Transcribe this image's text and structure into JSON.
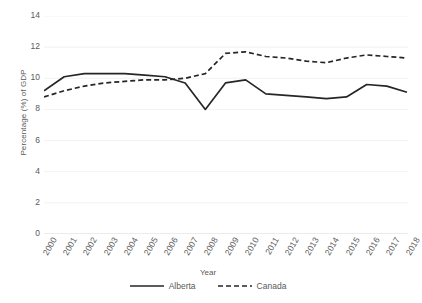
{
  "chart_data": {
    "type": "line",
    "title": "",
    "xlabel": "Year",
    "ylabel": "Percentage (%) of GDP",
    "x": [
      2000,
      2001,
      2002,
      2003,
      2004,
      2005,
      2006,
      2007,
      2008,
      2009,
      2010,
      2011,
      2012,
      2013,
      2014,
      2015,
      2016,
      2017,
      2018
    ],
    "categories": [
      "2000",
      "2001",
      "2002",
      "2003",
      "2004",
      "2005",
      "2006",
      "2007",
      "2008",
      "2009",
      "2010",
      "2011",
      "2012",
      "2013",
      "2014",
      "2015",
      "2016",
      "2017",
      "2018"
    ],
    "series": [
      {
        "name": "Alberta",
        "style": "solid",
        "color": "#262626",
        "values": [
          9.2,
          10.1,
          10.3,
          10.3,
          10.3,
          10.2,
          10.1,
          9.7,
          8.0,
          9.7,
          9.9,
          9.0,
          8.9,
          8.8,
          8.7,
          8.8,
          9.6,
          9.5,
          9.1
        ]
      },
      {
        "name": "Canada",
        "style": "dashed",
        "color": "#262626",
        "values": [
          8.8,
          9.2,
          9.5,
          9.7,
          9.8,
          9.9,
          9.9,
          10.0,
          10.3,
          11.6,
          11.7,
          11.4,
          11.3,
          11.1,
          11.0,
          11.3,
          11.5,
          11.4,
          11.3
        ]
      }
    ],
    "ylim": [
      0,
      14
    ],
    "yticks": [
      0,
      2,
      4,
      6,
      8,
      10,
      12,
      14
    ],
    "ytick_labels": [
      "0",
      "2",
      "4",
      "6",
      "8",
      "10",
      "12",
      "14"
    ],
    "grid": true,
    "grid_color": "#f2f2f2",
    "axis_color": "#d9d9d9",
    "legend_position": "bottom",
    "legend": [
      "Alberta",
      "Canada"
    ]
  }
}
